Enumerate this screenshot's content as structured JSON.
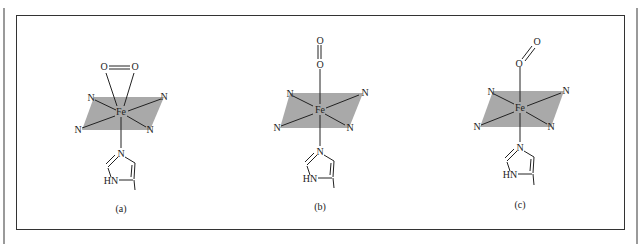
{
  "figure": {
    "panels": [
      {
        "id": "a",
        "caption": "(a)",
        "binding_mode": "side-on (η2) O2",
        "atoms": {
          "metal": "Fe",
          "o1": "O",
          "o2": "O",
          "n_tl": "N",
          "n_tr": "N",
          "n_bl": "N",
          "n_br": "N",
          "imid_n": "N",
          "imid_hn": "HN"
        }
      },
      {
        "id": "b",
        "caption": "(b)",
        "binding_mode": "end-on linear O2",
        "atoms": {
          "metal": "Fe",
          "o1": "O",
          "o2": "O",
          "n_tl": "N",
          "n_tr": "N",
          "n_bl": "N",
          "n_br": "N",
          "imid_n": "N",
          "imid_hn": "HN"
        }
      },
      {
        "id": "c",
        "caption": "(c)",
        "binding_mode": "end-on bent O2",
        "atoms": {
          "metal": "Fe",
          "o1": "O",
          "o2": "O",
          "n_tl": "N",
          "n_tr": "N",
          "n_bl": "N",
          "n_br": "N",
          "imid_n": "N",
          "imid_hn": "HN"
        }
      }
    ],
    "colors": {
      "plane_fill": "#a9a9a9",
      "line": "#222222",
      "frame": "#333333"
    }
  }
}
